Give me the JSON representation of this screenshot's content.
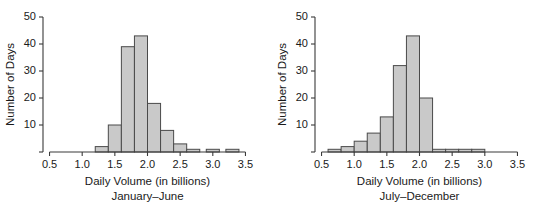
{
  "figure": {
    "background": "#ffffff",
    "bar_fill": "#c9c9c9",
    "bar_stroke": "#4a4a4a",
    "axis_color": "#3a3a3a"
  },
  "chart_data": [
    {
      "type": "bar",
      "title": "",
      "xlabel": "Daily Volume (in billions)",
      "ylabel": "Number of Days",
      "subtitle": "January–June",
      "xlim": [
        0.4,
        3.6
      ],
      "ylim": [
        0,
        50
      ],
      "xticks": [
        0.5,
        1.0,
        1.5,
        2.0,
        2.5,
        3.0,
        3.5
      ],
      "xtick_labels": [
        "0.5",
        "1.0",
        "1.5",
        "2.0",
        "2.5",
        "3.0",
        "3.5"
      ],
      "yticks": [
        0,
        10,
        20,
        30,
        40,
        50
      ],
      "ytick_labels": [
        "",
        "10",
        "20",
        "30",
        "40",
        "50"
      ],
      "grid": false,
      "legend": "none",
      "bin_width": 0.2,
      "bins": [
        {
          "left": 1.2,
          "right": 1.4,
          "value": 2
        },
        {
          "left": 1.4,
          "right": 1.6,
          "value": 10
        },
        {
          "left": 1.6,
          "right": 1.8,
          "value": 39
        },
        {
          "left": 1.8,
          "right": 2.0,
          "value": 43
        },
        {
          "left": 2.0,
          "right": 2.2,
          "value": 18
        },
        {
          "left": 2.2,
          "right": 2.4,
          "value": 8
        },
        {
          "left": 2.4,
          "right": 2.6,
          "value": 3
        },
        {
          "left": 2.6,
          "right": 2.8,
          "value": 1
        },
        {
          "left": 2.9,
          "right": 3.1,
          "value": 1
        },
        {
          "left": 3.2,
          "right": 3.4,
          "value": 1
        }
      ]
    },
    {
      "type": "bar",
      "title": "",
      "xlabel": "Daily Volume (in billions)",
      "ylabel": "Number of Days",
      "subtitle": "July–December",
      "xlim": [
        0.4,
        3.6
      ],
      "ylim": [
        0,
        50
      ],
      "xticks": [
        0.5,
        1.0,
        1.5,
        2.0,
        2.5,
        3.0,
        3.5
      ],
      "xtick_labels": [
        "0.5",
        "1.0",
        "1.5",
        "2.0",
        "2.5",
        "3.0",
        "3.5"
      ],
      "yticks": [
        0,
        10,
        20,
        30,
        40,
        50
      ],
      "ytick_labels": [
        "",
        "10",
        "20",
        "30",
        "40",
        "50"
      ],
      "grid": false,
      "legend": "none",
      "bin_width": 0.2,
      "bins": [
        {
          "left": 0.6,
          "right": 0.8,
          "value": 1
        },
        {
          "left": 0.8,
          "right": 1.0,
          "value": 2
        },
        {
          "left": 1.0,
          "right": 1.2,
          "value": 4
        },
        {
          "left": 1.2,
          "right": 1.4,
          "value": 7
        },
        {
          "left": 1.4,
          "right": 1.6,
          "value": 13
        },
        {
          "left": 1.6,
          "right": 1.8,
          "value": 32
        },
        {
          "left": 1.8,
          "right": 2.0,
          "value": 43
        },
        {
          "left": 2.0,
          "right": 2.2,
          "value": 20
        },
        {
          "left": 2.2,
          "right": 2.4,
          "value": 1
        },
        {
          "left": 2.4,
          "right": 2.6,
          "value": 1
        },
        {
          "left": 2.6,
          "right": 2.8,
          "value": 1
        },
        {
          "left": 2.8,
          "right": 3.0,
          "value": 1
        }
      ]
    }
  ]
}
